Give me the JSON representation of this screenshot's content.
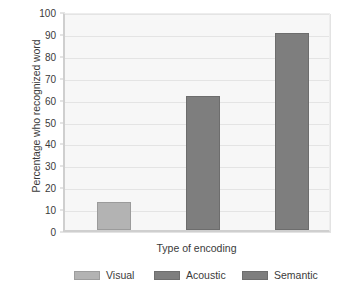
{
  "chart_data": {
    "type": "bar",
    "title": "",
    "subtitle": "",
    "xlabel": "Type of encoding",
    "ylabel": "Percentage who recognized word",
    "categories": [
      "Visual",
      "Acoustic",
      "Semantic"
    ],
    "values": [
      13,
      61,
      90
    ],
    "series": [
      {
        "name": "Percentage who recognized word",
        "values": [
          13,
          61,
          90
        ]
      }
    ],
    "ylim": [
      0,
      100
    ],
    "ytick_labels": [
      "0",
      "10",
      "20",
      "30",
      "40",
      "50",
      "60",
      "70",
      "80",
      "90",
      "100"
    ],
    "ytick_values": [
      0,
      10,
      20,
      30,
      40,
      50,
      60,
      70,
      80,
      90,
      100
    ],
    "xtick_labels": [],
    "grid": true,
    "grid_axis": "y",
    "legend_position": "bottom",
    "legend": [
      {
        "label": "Visual",
        "color": "#b3b3b3"
      },
      {
        "label": "Acoustic",
        "color": "#7e7e7e"
      },
      {
        "label": "Semantic",
        "color": "#7e7e7e"
      }
    ],
    "bar_colors": [
      "#b3b3b3",
      "#7e7e7e",
      "#7e7e7e"
    ],
    "plot_background": "#f7f7f7",
    "gridline_color": "#e4e4e4",
    "axis_color": "#cfcfcf",
    "text_color": "#3a3a3a",
    "annotations": []
  }
}
